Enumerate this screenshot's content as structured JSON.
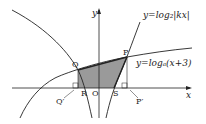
{
  "diagram": {
    "curves": [
      {
        "name": "log2-abs-kx",
        "label": "y=log₂|kx|"
      },
      {
        "name": "loga-x-plus-3",
        "label": "y=logₐ(x+3)"
      }
    ],
    "axes": {
      "x_label": "x",
      "y_label": "y",
      "origin": "O"
    },
    "points": {
      "P": "P",
      "Q": "Q",
      "R": "R",
      "S": "S",
      "Q_prime": "Q′",
      "P_prime": "P′"
    },
    "shading_color": "#9a9a9a",
    "shaded_region": "PQRS"
  }
}
